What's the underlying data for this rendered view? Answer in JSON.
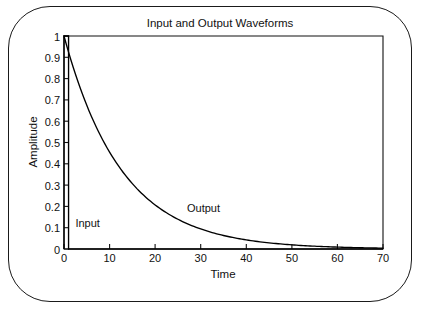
{
  "figure": {
    "title": "Input and Output Waveforms",
    "border_color": "#1a1a1a",
    "background_color": "#ffffff",
    "ink_color": "#000000"
  },
  "chart_data": {
    "type": "line",
    "title": "Input and Output Waveforms",
    "xlabel": "Time",
    "ylabel": "Amplitude",
    "xlim": [
      0,
      70
    ],
    "ylim": [
      0,
      1
    ],
    "grid": false,
    "legend": "annotations-inline",
    "xticks": [
      0,
      10,
      20,
      30,
      40,
      50,
      60,
      70
    ],
    "xtick_labels": [
      "0",
      "10",
      "20",
      "30",
      "40",
      "50",
      "60",
      "70"
    ],
    "yticks": [
      0,
      0.1,
      0.2,
      0.3,
      0.4,
      0.5,
      0.6,
      0.7,
      0.8,
      0.9,
      1
    ],
    "ytick_labels": [
      "0",
      "0.1",
      "0.2",
      "0.3",
      "0.4",
      "0.5",
      "0.6",
      "0.7",
      "0.8",
      "0.9",
      "1"
    ],
    "annotations": [
      {
        "text": "Input",
        "x": 2.5,
        "y": 0.105
      },
      {
        "text": "Output",
        "x": 27.0,
        "y": 0.175
      }
    ],
    "series": [
      {
        "name": "Input",
        "description": "Unit impulse: rises to 1 at t=0 and returns to 0 at t=1",
        "x": [
          0,
          0,
          1,
          1,
          70
        ],
        "values": [
          0,
          1,
          1,
          0,
          0
        ]
      },
      {
        "name": "Output",
        "description": "Exponential decay exp(-t/12.7) from amplitude 1 at t=0",
        "x": [
          0,
          2,
          4,
          6,
          8,
          10,
          12,
          14,
          16,
          18,
          20,
          22,
          24,
          26,
          28,
          30,
          32,
          34,
          36,
          38,
          40,
          45,
          50,
          55,
          60,
          65,
          70
        ],
        "values": [
          1.0,
          0.854,
          0.729,
          0.623,
          0.532,
          0.455,
          0.388,
          0.331,
          0.283,
          0.242,
          0.207,
          0.176,
          0.151,
          0.129,
          0.11,
          0.094,
          0.08,
          0.068,
          0.058,
          0.05,
          0.043,
          0.029,
          0.02,
          0.013,
          0.009,
          0.006,
          0.004
        ]
      }
    ]
  }
}
